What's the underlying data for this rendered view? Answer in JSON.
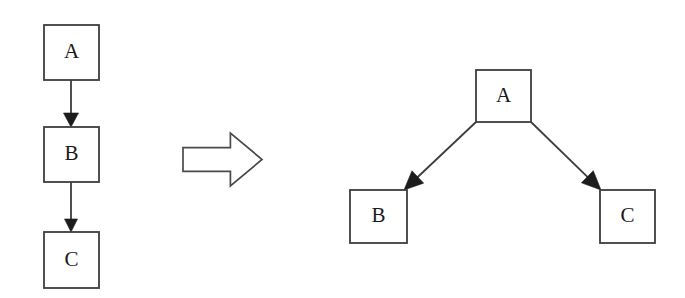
{
  "figure": {
    "background_color": "#ffffff",
    "stroke_color": "#3d3d3d",
    "text_color": "#1a1a1a",
    "arrowhead_color": "#1c1c1c"
  },
  "left_graph": {
    "name": "linear-chain",
    "layout": "vertical-chain",
    "nodes": [
      {
        "id": "A",
        "label": "A",
        "x": 44,
        "y": 25,
        "w": 55,
        "h": 55
      },
      {
        "id": "B",
        "label": "B",
        "x": 44,
        "y": 127,
        "w": 55,
        "h": 55
      },
      {
        "id": "C",
        "label": "C",
        "x": 44,
        "y": 232,
        "w": 55,
        "h": 56
      }
    ],
    "edges": [
      {
        "from": "A",
        "to": "B",
        "x1": 71,
        "y1": 80,
        "x2": 71,
        "y2": 127
      },
      {
        "from": "B",
        "to": "C",
        "x1": 71,
        "y1": 182,
        "x2": 71,
        "y2": 232
      }
    ]
  },
  "transform_arrow": {
    "label": "transforms-into",
    "direction": "right",
    "x": 183,
    "y": 133,
    "w": 79,
    "h": 53
  },
  "right_graph": {
    "name": "branching-tree",
    "layout": "tree-two-children",
    "nodes": [
      {
        "id": "A",
        "label": "A",
        "x": 476,
        "y": 70,
        "w": 55,
        "h": 52
      },
      {
        "id": "B",
        "label": "B",
        "x": 350,
        "y": 190,
        "w": 57,
        "h": 53
      },
      {
        "id": "C",
        "label": "C",
        "x": 600,
        "y": 190,
        "w": 55,
        "h": 53
      }
    ],
    "edges": [
      {
        "from": "A",
        "to": "B",
        "x1": 476,
        "y1": 122,
        "x2": 404,
        "y2": 190
      },
      {
        "from": "A",
        "to": "C",
        "x1": 531,
        "y1": 122,
        "x2": 601,
        "y2": 190
      }
    ]
  }
}
